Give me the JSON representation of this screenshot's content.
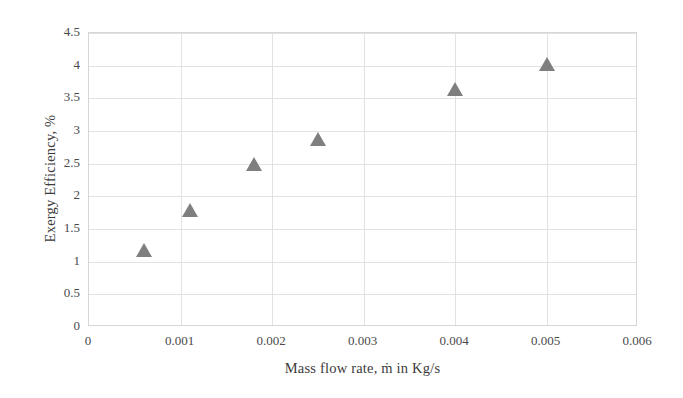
{
  "chart_data": {
    "type": "scatter",
    "title": "",
    "xlabel": "Mass flow rate, ṁ in Kg/s",
    "ylabel": "Exergy Efficiency, %",
    "x": [
      0.0006,
      0.0011,
      0.0018,
      0.0025,
      0.004,
      0.005
    ],
    "values": [
      1.18,
      1.79,
      2.5,
      2.88,
      3.65,
      4.03
    ],
    "series": [
      {
        "name": "Exergy Efficiency",
        "marker": "triangle",
        "color": "#7f7f7f",
        "points": [
          {
            "x": 0.0006,
            "y": 1.18
          },
          {
            "x": 0.0011,
            "y": 1.79
          },
          {
            "x": 0.0018,
            "y": 2.5
          },
          {
            "x": 0.0025,
            "y": 2.88
          },
          {
            "x": 0.004,
            "y": 3.65
          },
          {
            "x": 0.005,
            "y": 4.03
          }
        ]
      }
    ],
    "xlim": [
      0,
      0.006
    ],
    "ylim": [
      0,
      4.5
    ],
    "xticks": [
      0,
      0.001,
      0.002,
      0.003,
      0.004,
      0.005,
      0.006
    ],
    "xtick_labels": [
      "0",
      "0.001",
      "0.002",
      "0.003",
      "0.004",
      "0.005",
      "0.006"
    ],
    "yticks": [
      0,
      0.5,
      1,
      1.5,
      2,
      2.5,
      3,
      3.5,
      4,
      4.5
    ],
    "ytick_labels": [
      "0",
      "0.5",
      "1",
      "1.5",
      "2",
      "2.5",
      "3",
      "3.5",
      "4",
      "4.5"
    ],
    "grid": {
      "horizontal": true,
      "vertical": true,
      "color": "#e2e2e2"
    },
    "legend": null,
    "plot_background": "#ffffff",
    "border_color": "#d6d6d6"
  }
}
